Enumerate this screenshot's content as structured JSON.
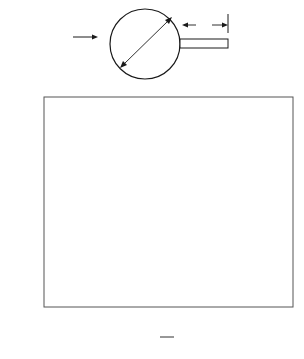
{
  "diagram": {
    "freestream_label": "u",
    "freestream_subscript": "∞",
    "diameter_label": "d",
    "plate_length_label": "L"
  },
  "chart_data": {
    "type": "scatter",
    "title": "",
    "xlabel_numerator": "L",
    "xlabel_denominator": "d",
    "ylabel": "S",
    "xlim": [
      0,
      2
    ],
    "ylim": [
      0.17,
      0.21
    ],
    "grid": false,
    "legend": null,
    "x_ticks": [
      {
        "label": "0",
        "px": 44
      },
      {
        "label": "1",
        "px": 144
      },
      {
        "label": "2",
        "px": 293
      }
    ],
    "x_minor_tick_px": [
      94,
      194,
      243
    ],
    "y_ticks": [
      {
        "label": "0.21",
        "value": 0.21
      },
      {
        "label": "0.20",
        "value": 0.2
      },
      {
        "label": "0.19",
        "value": 0.19
      },
      {
        "label": "0.18",
        "value": 0.18
      },
      {
        "label": "0.17",
        "value": 0.17
      }
    ],
    "series": [
      {
        "name": "Strouhal number",
        "points": [
          {
            "x": 0.0,
            "y": 0.2041,
            "px": 44
          },
          {
            "x": 0.0,
            "y": 0.2014,
            "px": 44
          },
          {
            "x": 0.2,
            "y": 0.2043,
            "px": 64
          },
          {
            "x": 0.2,
            "y": 0.2028,
            "px": 64
          },
          {
            "x": 0.38,
            "y": 0.1984,
            "px": 82
          },
          {
            "x": 0.67,
            "y": 0.1847,
            "px": 111
          },
          {
            "x": 1.03,
            "y": 0.1851,
            "px": 147
          },
          {
            "x": 1.03,
            "y": 0.1835,
            "px": 147
          },
          {
            "x": 1.17,
            "y": 0.1845,
            "px": 161
          },
          {
            "x": 1.29,
            "y": 0.1837,
            "px": 173
          },
          {
            "x": 1.2,
            "y": 0.1814,
            "px": 164
          },
          {
            "x": 1.06,
            "y": 0.1795,
            "px": 150
          },
          {
            "x": 1.46,
            "y": 0.1898,
            "px": 210
          },
          {
            "x": 1.72,
            "y": 0.1981,
            "px": 250
          }
        ]
      }
    ]
  }
}
